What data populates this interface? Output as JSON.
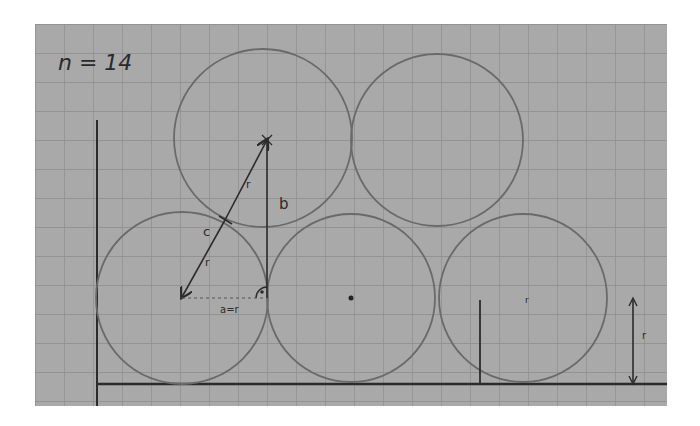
{
  "diagram": {
    "title_label": "n = 14",
    "paper": {
      "x": 35,
      "y": 24,
      "width": 632,
      "height": 382,
      "color": "#a9a9a9",
      "grid_color": "#8f8f8f",
      "grid_step": 29
    },
    "ink_color": "#2b2b2b",
    "pencil_color": "#6e6e6e",
    "circles": [
      {
        "id": "bottom-left",
        "cx": 182,
        "cy": 298,
        "r": 86
      },
      {
        "id": "bottom-middle",
        "cx": 351,
        "cy": 298,
        "r": 84
      },
      {
        "id": "bottom-right",
        "cx": 523,
        "cy": 298,
        "r": 84
      },
      {
        "id": "top-left",
        "cx": 263,
        "cy": 138,
        "r": 89
      },
      {
        "id": "top-right",
        "cx": 437,
        "cy": 140,
        "r": 86
      }
    ],
    "labels": {
      "r_upper": "r",
      "r_lower": "r",
      "c": "c",
      "b": "b",
      "a_eq_r": "a=r",
      "r_height": "r"
    }
  }
}
